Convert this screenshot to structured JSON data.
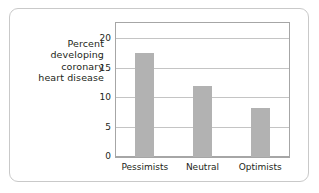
{
  "chart_data": {
    "type": "bar",
    "title": "",
    "subtitle": "",
    "xlabel": "",
    "ylabel": "Percent developing coronary heart disease",
    "ylabel_lines": [
      "Percent",
      "developing",
      "coronary",
      "heart disease"
    ],
    "categories": [
      "Pessimists",
      "Neutral",
      "Optimists"
    ],
    "values": [
      17.5,
      12.0,
      8.2
    ],
    "ylim": [
      0,
      22.5
    ],
    "yticks": [
      0,
      5,
      10,
      15,
      20
    ],
    "ytick_labels": [
      "0",
      "5",
      "10",
      "15",
      "20"
    ],
    "grid": true,
    "grid_axis": "y",
    "legend": false,
    "legend_position": "none",
    "bar_color": "#b2b2b2",
    "gridline_color": "#c4c4c4",
    "axis_color": "#a6a6a6",
    "text_color": "#231f20",
    "background_color": "#ffffff",
    "card_border_color": "#c9c9c9"
  }
}
